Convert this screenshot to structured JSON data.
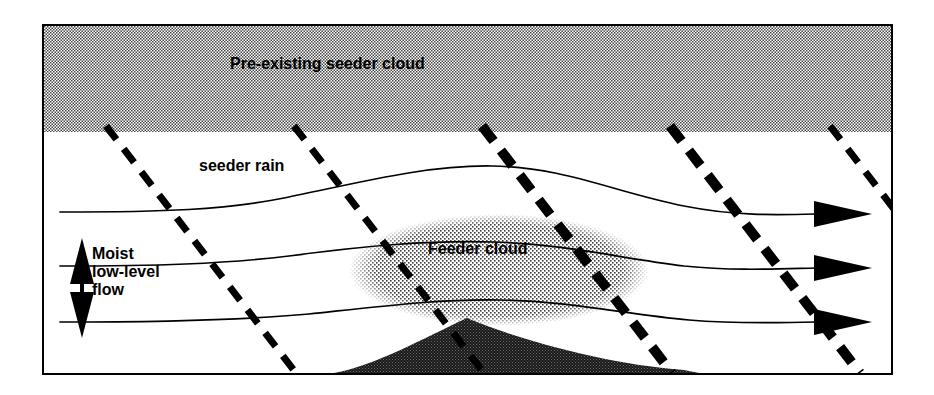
{
  "figure": {
    "type": "schematic-diagram",
    "frame": {
      "x": 42,
      "y": 24,
      "width": 851,
      "height": 351,
      "border_color": "#000000"
    },
    "background_color": "#ffffff",
    "ink_color": "#000000"
  },
  "labels": {
    "seeder_band": "Pre-existing seeder cloud",
    "seeder_rain": "seeder rain",
    "feeder_cloud": "Feeder cloud",
    "flow_line_1": "Moist",
    "flow_line_2": "low-level",
    "flow_line_3": "flow"
  },
  "elements": {
    "seeder_band": {
      "name": "pre-existing seeder cloud band",
      "shape": "rectangle",
      "fill": "dithered-gray",
      "fill_color": "#b0b0b0",
      "x": 0,
      "y": 0,
      "width": 847,
      "height": 106
    },
    "feeder_cloud": {
      "name": "feeder cloud",
      "shape": "ellipse",
      "fill": "dithered-gray",
      "fill_color": "#c6c6c6",
      "cx": 455,
      "cy": 244,
      "rx": 148,
      "ry": 54
    },
    "mountain": {
      "name": "mountain terrain",
      "shape": "hill-silhouette",
      "fill": "dithered-dark",
      "fill_color": "#2a2a2a",
      "peak_x": 423,
      "peak_y": 292,
      "left_base_x": 290,
      "right_base_x": 655
    },
    "vertical_arrow": {
      "name": "moist low-level flow depth arrow",
      "style": "double-headed vertical",
      "x": 38,
      "top_y": 216,
      "bottom_y": 308
    }
  },
  "streamlines": {
    "count": 3,
    "direction": "left-to-right",
    "arrowhead": "solid-triangle",
    "items": [
      {
        "id": "streamline-upper",
        "label_hint": "seeder rain level flow",
        "inlet_y": 186,
        "crest_y": 140,
        "outlet_y": 188
      },
      {
        "id": "streamline-middle",
        "label_hint": "mid-level flow through feeder cloud",
        "inlet_y": 240,
        "crest_y": 216,
        "outlet_y": 242
      },
      {
        "id": "streamline-lower",
        "label_hint": "low-level flow over terrain",
        "inlet_y": 296,
        "crest_y": 274,
        "outlet_y": 296
      }
    ]
  },
  "rain_trajectories": {
    "count": 5,
    "style": "dashed",
    "description": "seeder rain falling from the pre-existing seeder cloud, sloping down to the right",
    "items": [
      {
        "id": "rain-dash-1",
        "thickness": "medium",
        "x_top": 62,
        "x_bottom": 245
      },
      {
        "id": "rain-dash-2",
        "thickness": "medium",
        "x_top": 250,
        "x_bottom": 432
      },
      {
        "id": "rain-dash-3",
        "thickness": "heavy",
        "x_top": 432,
        "x_bottom": 614
      },
      {
        "id": "rain-dash-4",
        "thickness": "heavy",
        "x_top": 614,
        "x_bottom": 796
      },
      {
        "id": "rain-dash-5",
        "thickness": "medium",
        "x_top": 784,
        "x_bottom": 847
      }
    ]
  }
}
